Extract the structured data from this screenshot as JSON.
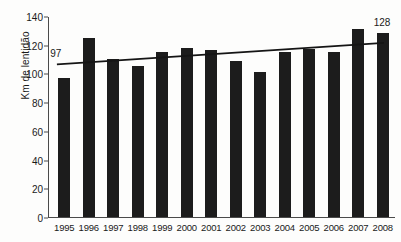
{
  "chart_data": {
    "type": "bar",
    "title": "",
    "xlabel": "",
    "ylabel": "Km de lentidão",
    "categories": [
      "1995",
      "1996",
      "1997",
      "1998",
      "1999",
      "2000",
      "2001",
      "2002",
      "2003",
      "2004",
      "2005",
      "2006",
      "2007",
      "2008"
    ],
    "values": [
      97,
      125,
      110,
      105,
      115,
      118,
      116,
      109,
      101,
      115,
      117,
      115,
      131,
      128
    ],
    "ylim": [
      0,
      140
    ],
    "yticks": [
      0,
      20,
      40,
      60,
      80,
      100,
      120,
      140
    ],
    "grid": false,
    "legend": false,
    "bar_color": "#1c1c1c",
    "series": [
      {
        "name": "Km de lentidão",
        "values": [
          97,
          125,
          110,
          105,
          115,
          118,
          116,
          109,
          101,
          115,
          117,
          115,
          131,
          128
        ]
      },
      {
        "name": "trendline",
        "type": "line",
        "x_start": "1995",
        "x_end": "2008",
        "y_start": 107,
        "y_end": 122,
        "color": "#151515"
      }
    ],
    "annotations": [
      {
        "text": "97",
        "category": "1995",
        "value": 97
      },
      {
        "text": "128",
        "category": "2008",
        "value": 128
      }
    ]
  }
}
